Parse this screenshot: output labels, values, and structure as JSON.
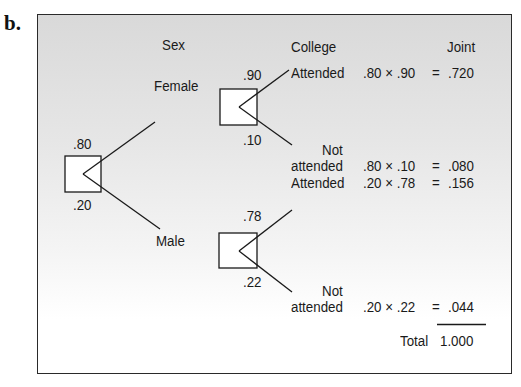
{
  "figure_label": "b.",
  "headers": {
    "sex": "Sex",
    "college": "College",
    "joint": "Joint"
  },
  "root": {
    "prob_top": ".80",
    "prob_bottom": ".20"
  },
  "branches": [
    {
      "label": "Female",
      "prob": ".80",
      "sub_prob_top": ".90",
      "sub_prob_bottom": ".10",
      "outcomes": [
        {
          "label_line1": "",
          "label_line2": "Attended",
          "expr": ".80 × .90",
          "eq": "=",
          "joint": ".720"
        },
        {
          "label_line1": "Not",
          "label_line2": "attended",
          "expr": ".80 × .10",
          "eq": "=",
          "joint": ".080"
        }
      ]
    },
    {
      "label": "Male",
      "prob": ".20",
      "sub_prob_top": ".78",
      "sub_prob_bottom": ".22",
      "outcomes": [
        {
          "label_line1": "",
          "label_line2": "Attended",
          "expr": ".20 × .78",
          "eq": "=",
          "joint": ".156"
        },
        {
          "label_line1": "Not",
          "label_line2": "attended",
          "expr": ".20 × .22",
          "eq": "=",
          "joint": ".044"
        }
      ]
    }
  ],
  "total": {
    "label": "Total",
    "value": "1.000"
  },
  "colors": {
    "line": "#1a1a1a",
    "frame_bg_top": "#d9d9d9",
    "frame_bg_bottom": "#ffffff",
    "node_fill": "#ffffff"
  }
}
